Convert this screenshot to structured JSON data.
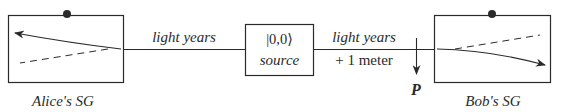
{
  "diagram": {
    "alice": {
      "label": "Alice's SG"
    },
    "bob": {
      "label": "Bob's SG"
    },
    "source": {
      "state": "|0,0⟩",
      "label": "source"
    },
    "left_link": {
      "distance": "light years"
    },
    "right_link": {
      "distance": "light years",
      "extra": "+ 1 meter"
    },
    "measurement_point": {
      "label": "P"
    },
    "colors": {
      "stroke": "#2a2a2a",
      "background": "#ffffff"
    }
  }
}
